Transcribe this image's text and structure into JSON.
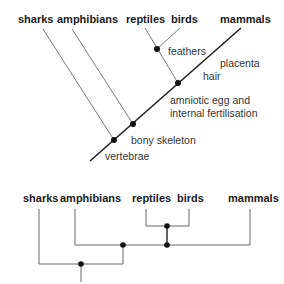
{
  "top_tree": {
    "type": "cladogram-diagonal",
    "taxa": [
      {
        "name": "sharks",
        "x": 18
      },
      {
        "name": "amphibians",
        "x": 57
      },
      {
        "name": "reptiles",
        "x": 126
      },
      {
        "name": "birds",
        "x": 171
      },
      {
        "name": "mammals",
        "x": 220
      }
    ],
    "traits": {
      "feathers": "feathers",
      "placenta": "placenta",
      "hair": "hair",
      "amniotic_line1": "amniotic egg and",
      "amniotic_line2": "internal fertilisation",
      "bony_skeleton": "bony skeleton",
      "vertebrae": "vertebrae"
    }
  },
  "bottom_tree": {
    "type": "cladogram-rectangular",
    "taxa": [
      {
        "name": "sharks"
      },
      {
        "name": "amphibians"
      },
      {
        "name": "reptiles"
      },
      {
        "name": "birds"
      },
      {
        "name": "mammals"
      }
    ]
  },
  "colors": {
    "line": "#222222",
    "thin_line": "#555555",
    "node": "#111111"
  }
}
